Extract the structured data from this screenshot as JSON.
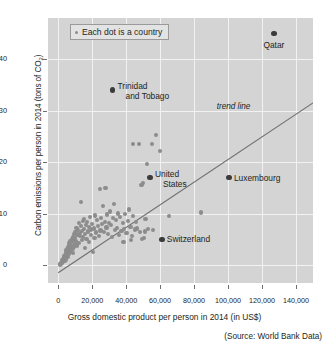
{
  "chart_data": {
    "type": "scatter",
    "title": "",
    "xlabel": "Gross domestic product per person in 2014 (in US$)",
    "ylabel_parts": {
      "before": "Carbon emissions per person in 2014 (tons of CO",
      "sub": "2",
      "after": ")"
    },
    "ylabel": "Carbon emissions per person in 2014 (tons of CO2)",
    "source": "(Source: World Bank Data)",
    "legend": {
      "label": "Each dot is a country",
      "position": "top-left-inside",
      "marker": "dot"
    },
    "grid": true,
    "plot_background": "#d4d4d4",
    "grid_color": "#f2f2f2",
    "dot_color": "#8c8c8c",
    "highlight_dot_color": "#3b3b3b",
    "trend_line_color": "#6e6e6e",
    "xlim": [
      -6000,
      150000
    ],
    "ylim": [
      -3.5,
      48
    ],
    "xticks": [
      0,
      20000,
      40000,
      60000,
      80000,
      100000,
      120000,
      140000
    ],
    "xticklabels": [
      "0",
      "20,000",
      "40,000",
      "60,000",
      "80,000",
      "100,000",
      "120,000",
      "140,000"
    ],
    "yticks": [
      0,
      10,
      20,
      30,
      40
    ],
    "yticklabels": [
      "0",
      "10",
      "20",
      "30",
      "40"
    ],
    "trend_line": {
      "label": "trend line",
      "x1": 0,
      "y1": -1.5,
      "x2": 150000,
      "y2": 31.5
    },
    "annotations": [
      {
        "name": "qatar",
        "text": "Qatar",
        "x": 127000,
        "y": 45.0,
        "align": "center",
        "dx": 0,
        "dy": 7
      },
      {
        "name": "trinidad-and-tobago",
        "text": "Trinidad\nand Tobago",
        "x": 32000,
        "y": 34.0,
        "align": "left",
        "dx": 5,
        "dy": -4
      },
      {
        "name": "united-states",
        "text": "United\nStates",
        "x": 54000,
        "y": 17.0,
        "align": "left",
        "dx": 5,
        "dy": -4
      },
      {
        "name": "luxembourg",
        "text": "Luxembourg",
        "x": 100500,
        "y": 17.0,
        "align": "left",
        "dx": 5,
        "dy": 0
      },
      {
        "name": "switzerland",
        "text": "Switzerland",
        "x": 61000,
        "y": 5.0,
        "align": "left",
        "dx": 5,
        "dy": 0
      }
    ],
    "highlighted_points": [
      {
        "name": "Qatar",
        "x": 127000,
        "y": 45.0
      },
      {
        "name": "Trinidad and Tobago",
        "x": 32000,
        "y": 34.0
      },
      {
        "name": "United States",
        "x": 54000,
        "y": 17.0
      },
      {
        "name": "Luxembourg",
        "x": 100500,
        "y": 17.0
      },
      {
        "name": "Switzerland",
        "x": 61000,
        "y": 5.0
      }
    ],
    "points": [
      [
        1000,
        0.1
      ],
      [
        1200,
        0.2
      ],
      [
        1500,
        0.3
      ],
      [
        1700,
        0.15
      ],
      [
        1900,
        0.45
      ],
      [
        2100,
        0.6
      ],
      [
        2300,
        0.35
      ],
      [
        2500,
        0.9
      ],
      [
        2700,
        0.55
      ],
      [
        2900,
        1.2
      ],
      [
        3100,
        0.8
      ],
      [
        3300,
        1.5
      ],
      [
        3500,
        1.1
      ],
      [
        3700,
        1.8
      ],
      [
        3900,
        0.7
      ],
      [
        4100,
        2.0
      ],
      [
        4300,
        1.4
      ],
      [
        4500,
        2.4
      ],
      [
        4700,
        1.0
      ],
      [
        4900,
        2.8
      ],
      [
        5100,
        1.9
      ],
      [
        5300,
        3.1
      ],
      [
        5500,
        2.2
      ],
      [
        5700,
        3.5
      ],
      [
        5900,
        1.6
      ],
      [
        6100,
        2.6
      ],
      [
        6300,
        3.9
      ],
      [
        6500,
        2.1
      ],
      [
        6700,
        4.2
      ],
      [
        6900,
        3.0
      ],
      [
        7100,
        2.5
      ],
      [
        7300,
        4.6
      ],
      [
        7500,
        3.4
      ],
      [
        7700,
        2.9
      ],
      [
        7900,
        5.1
      ],
      [
        8100,
        3.7
      ],
      [
        8300,
        4.4
      ],
      [
        8500,
        2.3
      ],
      [
        8700,
        5.5
      ],
      [
        8900,
        3.2
      ],
      [
        9100,
        4.9
      ],
      [
        9300,
        6.0
      ],
      [
        9500,
        3.6
      ],
      [
        9700,
        5.2
      ],
      [
        9900,
        4.1
      ],
      [
        10200,
        6.4
      ],
      [
        10500,
        4.7
      ],
      [
        10800,
        7.2
      ],
      [
        11100,
        3.8
      ],
      [
        11400,
        5.8
      ],
      [
        11700,
        6.8
      ],
      [
        12000,
        4.3
      ],
      [
        12300,
        8.1
      ],
      [
        12600,
        5.6
      ],
      [
        12900,
        6.2
      ],
      [
        13200,
        7.5
      ],
      [
        13500,
        12.3
      ],
      [
        13800,
        4.8
      ],
      [
        14100,
        6.6
      ],
      [
        14400,
        8.6
      ],
      [
        14700,
        5.4
      ],
      [
        15000,
        9.0
      ],
      [
        15300,
        7.0
      ],
      [
        15600,
        6.1
      ],
      [
        15900,
        3.3
      ],
      [
        16300,
        7.8
      ],
      [
        16700,
        5.0
      ],
      [
        17100,
        8.3
      ],
      [
        17500,
        6.5
      ],
      [
        17900,
        4.5
      ],
      [
        18300,
        7.4
      ],
      [
        18700,
        9.4
      ],
      [
        19100,
        5.9
      ],
      [
        19500,
        6.9
      ],
      [
        19900,
        8.0
      ],
      [
        20400,
        2.6
      ],
      [
        20900,
        7.1
      ],
      [
        21400,
        5.3
      ],
      [
        21900,
        9.6
      ],
      [
        22400,
        6.3
      ],
      [
        22900,
        8.8
      ],
      [
        23400,
        7.6
      ],
      [
        23900,
        5.7
      ],
      [
        24400,
        14.8
      ],
      [
        24900,
        6.7
      ],
      [
        25400,
        9.2
      ],
      [
        25900,
        7.9
      ],
      [
        26400,
        11.4
      ],
      [
        26900,
        6.4
      ],
      [
        27400,
        8.4
      ],
      [
        27900,
        14.9
      ],
      [
        28400,
        7.3
      ],
      [
        28900,
        9.8
      ],
      [
        29400,
        6.0
      ],
      [
        29900,
        8.2
      ],
      [
        30500,
        10.4
      ],
      [
        31100,
        7.7
      ],
      [
        31700,
        5.5
      ],
      [
        32300,
        9.1
      ],
      [
        32900,
        11.9
      ],
      [
        33500,
        6.8
      ],
      [
        34100,
        8.7
      ],
      [
        34700,
        7.2
      ],
      [
        35300,
        10.0
      ],
      [
        35900,
        5.8
      ],
      [
        36600,
        9.3
      ],
      [
        37300,
        6.6
      ],
      [
        38000,
        8.1
      ],
      [
        38700,
        7.0
      ],
      [
        39400,
        9.9
      ],
      [
        40200,
        6.2
      ],
      [
        41000,
        8.5
      ],
      [
        41800,
        10.8
      ],
      [
        42600,
        7.4
      ],
      [
        43400,
        5.6
      ],
      [
        44200,
        9.5
      ],
      [
        45000,
        6.9
      ],
      [
        45800,
        8.3
      ],
      [
        46600,
        7.1
      ],
      [
        47400,
        23.5
      ],
      [
        48200,
        6.4
      ],
      [
        49000,
        15.6
      ],
      [
        49800,
        15.9
      ],
      [
        50600,
        5.2
      ],
      [
        51400,
        8.9
      ],
      [
        52200,
        19.7
      ],
      [
        53000,
        7.0
      ],
      [
        44000,
        23.5
      ],
      [
        55000,
        23.5
      ],
      [
        57500,
        25.2
      ],
      [
        60000,
        22.2
      ],
      [
        51000,
        6.5
      ],
      [
        56000,
        6.8
      ],
      [
        65000,
        9.5
      ],
      [
        84000,
        10.2
      ],
      [
        43000,
        4.8
      ],
      [
        38500,
        4.4
      ],
      [
        49500,
        5.0
      ]
    ]
  }
}
